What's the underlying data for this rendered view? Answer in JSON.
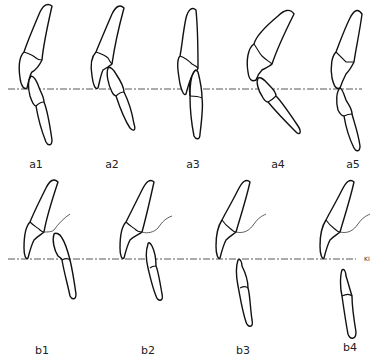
{
  "figure": {
    "row_a": {
      "panels": [
        {
          "id": "a1",
          "label": "a1"
        },
        {
          "id": "a2",
          "label": "a2"
        },
        {
          "id": "a3",
          "label": "a3"
        },
        {
          "id": "a4",
          "label": "a4"
        },
        {
          "id": "a5",
          "label": "a5"
        }
      ]
    },
    "row_b": {
      "panels": [
        {
          "id": "b1",
          "label": "b1"
        },
        {
          "id": "b2",
          "label": "b2"
        },
        {
          "id": "b3",
          "label": "b3"
        },
        {
          "id": "b4",
          "label": "b4"
        }
      ],
      "line_label": "KI"
    },
    "colors": {
      "stroke": "#111111",
      "background": "#ffffff"
    }
  }
}
